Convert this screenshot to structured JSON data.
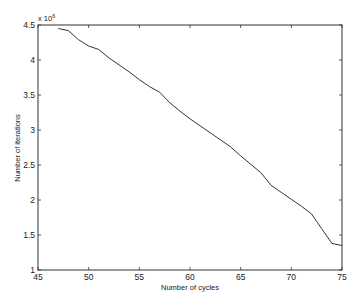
{
  "chart_data": {
    "type": "line",
    "title": "",
    "xlabel": "Number of cycles",
    "ylabel": "Number of iterations",
    "y_multiplier": "x 10^6",
    "y_multiplier_base": "x 10",
    "y_multiplier_exp": "6",
    "xlim": [
      45,
      75
    ],
    "ylim": [
      1,
      4.5
    ],
    "xticks": [
      45,
      50,
      55,
      60,
      65,
      70,
      75
    ],
    "yticks": [
      1,
      1.5,
      2,
      2.5,
      3,
      3.5,
      4,
      4.5
    ],
    "xtick_labels": [
      "45",
      "50",
      "55",
      "60",
      "65",
      "70",
      "75"
    ],
    "ytick_labels": [
      "1",
      "1.5",
      "2",
      "2.5",
      "3",
      "3.5",
      "4",
      "4.5"
    ],
    "grid": false,
    "legend": null,
    "series": [
      {
        "name": "iterations",
        "color": "#333333",
        "x": [
          47,
          48,
          49,
          50,
          51,
          52,
          53,
          54,
          55,
          56,
          57,
          58,
          59,
          60,
          61,
          62,
          63,
          64,
          65,
          66,
          67,
          68,
          69,
          70,
          71,
          72,
          73,
          74,
          75
        ],
        "y": [
          4.45,
          4.42,
          4.29,
          4.2,
          4.15,
          4.03,
          3.93,
          3.83,
          3.72,
          3.62,
          3.54,
          3.39,
          3.27,
          3.16,
          3.06,
          2.96,
          2.86,
          2.76,
          2.63,
          2.51,
          2.39,
          2.21,
          2.11,
          2.01,
          1.91,
          1.8,
          1.59,
          1.38,
          1.35
        ]
      }
    ]
  }
}
